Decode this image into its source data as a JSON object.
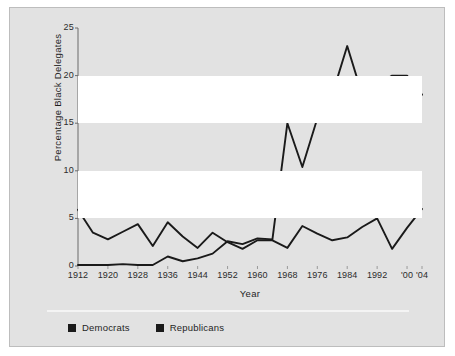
{
  "chart_data": {
    "type": "line",
    "title": "",
    "xlabel": "Year",
    "ylabel": "Percentage Black Delegates",
    "xlim": [
      1912,
      2004
    ],
    "ylim": [
      0,
      25
    ],
    "yticks": [
      0,
      5,
      10,
      15,
      20,
      25
    ],
    "ytick_labels": [
      "0",
      "5",
      "10",
      "15",
      "20",
      "25"
    ],
    "x": [
      1912,
      1916,
      1920,
      1924,
      1928,
      1932,
      1936,
      1940,
      1944,
      1948,
      1952,
      1956,
      1960,
      1964,
      1968,
      1972,
      1976,
      1980,
      1984,
      1988,
      1992,
      1996,
      2000,
      2004
    ],
    "xtick_values": [
      1912,
      1920,
      1928,
      1936,
      1944,
      1952,
      1960,
      1968,
      1976,
      1984,
      1992,
      2000,
      2004
    ],
    "xtick_labels": [
      "1912",
      "1920",
      "1928",
      "1936",
      "1944",
      "1952",
      "1960",
      "1968",
      "1976",
      "1984",
      "1992",
      "'00",
      "'04"
    ],
    "grid": "horizontal-bands",
    "legend_position": "bottom-left",
    "series": [
      {
        "name": "Democrats",
        "color": "#1a1a1a",
        "values": [
          0.1,
          0.1,
          0.1,
          0.2,
          0.1,
          0.1,
          1.0,
          0.5,
          0.8,
          1.3,
          2.6,
          2.3,
          2.9,
          2.8,
          15.0,
          10.4,
          15.5,
          18.0,
          23.1,
          18.0,
          19.0,
          20.0,
          20.0,
          18.0
        ]
      },
      {
        "name": "Republicans",
        "color": "#1a1a1a",
        "values": [
          5.9,
          3.5,
          2.8,
          3.6,
          4.4,
          2.1,
          4.6,
          3.1,
          1.9,
          3.5,
          2.5,
          1.8,
          2.7,
          2.7,
          1.9,
          4.2,
          3.4,
          2.7,
          3.0,
          4.1,
          5.0,
          1.8,
          4.0,
          6.0
        ]
      }
    ]
  },
  "legend": {
    "items": [
      {
        "label": "Democrats"
      },
      {
        "label": "Republicans"
      }
    ]
  }
}
